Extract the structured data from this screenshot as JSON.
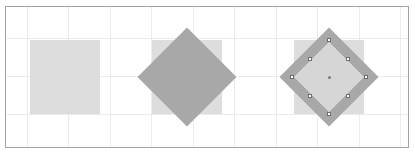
{
  "figure": {
    "width": 415,
    "height": 158,
    "background_color": "#ffffff"
  },
  "canvas": {
    "frame": {
      "x": 5,
      "y": 6,
      "width": 404,
      "height": 142,
      "border_color": "#a3a3a3",
      "fill_color": "#ffffff"
    },
    "grid": {
      "visible": true,
      "line_color": "#ebebeb",
      "cell_width": 41,
      "cell_height": 38,
      "vertical_positions": [
        21,
        62,
        104,
        145,
        187,
        228,
        270,
        311,
        353,
        394
      ],
      "horizontal_positions": [
        31,
        69,
        107
      ]
    }
  },
  "shapes": [
    {
      "id": "shape-1",
      "name": "original-square",
      "type": "square",
      "state": "unrotated",
      "selected": false,
      "rotation_degrees": 0,
      "fill_color": "#dcdcdc",
      "x": 24,
      "y": 33,
      "width": 70,
      "height": 74
    },
    {
      "id": "shape-2",
      "name": "rotated-diamond",
      "type": "square",
      "state": "rotated",
      "selected": false,
      "rotation_degrees": 45,
      "fill_color": "#a8a8a8",
      "ghost_fill_color": "#dddddd",
      "ghost_x": 146,
      "ghost_y": 33,
      "ghost_width": 70,
      "ghost_height": 74,
      "center_x": 181,
      "center_y": 70,
      "side": 70
    },
    {
      "id": "shape-3",
      "name": "selected-rotated-diamond",
      "type": "square",
      "state": "rotated-selected",
      "selected": true,
      "rotation_degrees": 45,
      "outer_fill_color": "#a8a8a8",
      "inner_fill_color": "#d6d6d6",
      "inner_stroke_color": "#9b9b9b",
      "ghost_fill_color": "#dddddd",
      "ghost_x": 288,
      "ghost_y": 33,
      "ghost_width": 70,
      "ghost_height": 74,
      "center_x": 323,
      "center_y": 70,
      "outer_side": 70,
      "inner_side": 52,
      "handle_fill_color": "#ffffff",
      "handle_stroke_color": "#6e6e6e",
      "handle_size": 4,
      "center_marker_color": "#7a7a7a",
      "handles": [
        {
          "name": "handle-top",
          "x": 323,
          "y": 33
        },
        {
          "name": "handle-top-right",
          "x": 342,
          "y": 52
        },
        {
          "name": "handle-right",
          "x": 360,
          "y": 70
        },
        {
          "name": "handle-bottom-right",
          "x": 342,
          "y": 89
        },
        {
          "name": "handle-bottom",
          "x": 323,
          "y": 107
        },
        {
          "name": "handle-bottom-left",
          "x": 304,
          "y": 89
        },
        {
          "name": "handle-left",
          "x": 286,
          "y": 70
        },
        {
          "name": "handle-top-left",
          "x": 304,
          "y": 52
        }
      ]
    }
  ]
}
